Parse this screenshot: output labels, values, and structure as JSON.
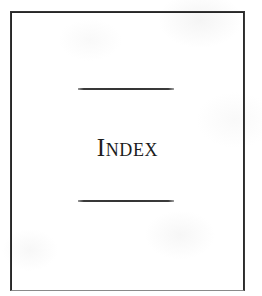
{
  "page": {
    "type": "book-section-divider",
    "background_color": "#ffffff",
    "paper_color": "#fdfdfd"
  },
  "frame": {
    "name": "page-border",
    "border_color": "#272727",
    "bottom_border_color": "#9a9a9a"
  },
  "divider_top": {
    "label": "",
    "color": "#333333"
  },
  "divider_bottom": {
    "label": "",
    "color": "#333333"
  },
  "main": {
    "title": "Index",
    "title_color": "#1c1c1c",
    "title_style": "small-caps"
  }
}
